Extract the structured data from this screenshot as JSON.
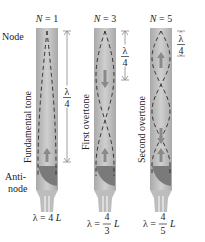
{
  "labels": {
    "node": "Node",
    "antinode_line1": "Anti-",
    "antinode_line2": "node"
  },
  "pipes": [
    {
      "n_label": "N = 1",
      "n_var": "N",
      "n_value": "1",
      "mode_name": "Fundamental tone",
      "lambda_formula": "λ = 4 L",
      "lambda_prefix": "λ =",
      "lambda_num": "4",
      "lambda_den": "",
      "lambda_suffix": "L",
      "quarter_wave_label_num": "λ",
      "quarter_wave_label_den": "4",
      "loops": 1
    },
    {
      "n_label": "N = 3",
      "n_var": "N",
      "n_value": "3",
      "mode_name": "First overtone",
      "lambda_formula": "λ = 4/3 L",
      "lambda_prefix": "λ =",
      "lambda_num": "4",
      "lambda_den": "3",
      "lambda_suffix": "L",
      "quarter_wave_label_num": "λ",
      "quarter_wave_label_den": "4",
      "loops": 3
    },
    {
      "n_label": "N = 5",
      "n_var": "N",
      "n_value": "5",
      "mode_name": "Second overtone",
      "lambda_formula": "λ = 4/5 L",
      "lambda_prefix": "λ =",
      "lambda_num": "4",
      "lambda_den": "5",
      "lambda_suffix": "L",
      "quarter_wave_label_num": "λ",
      "quarter_wave_label_den": "4",
      "loops": 5
    }
  ],
  "colors": {
    "pipe_body": "#b9b9b9",
    "pipe_highlight": "#d6d6d6",
    "mouthpiece_dark": "#7a7a7a",
    "wave_dash": "#333333",
    "arrow": "#8a8a8a",
    "dimension_line": "#888888"
  }
}
